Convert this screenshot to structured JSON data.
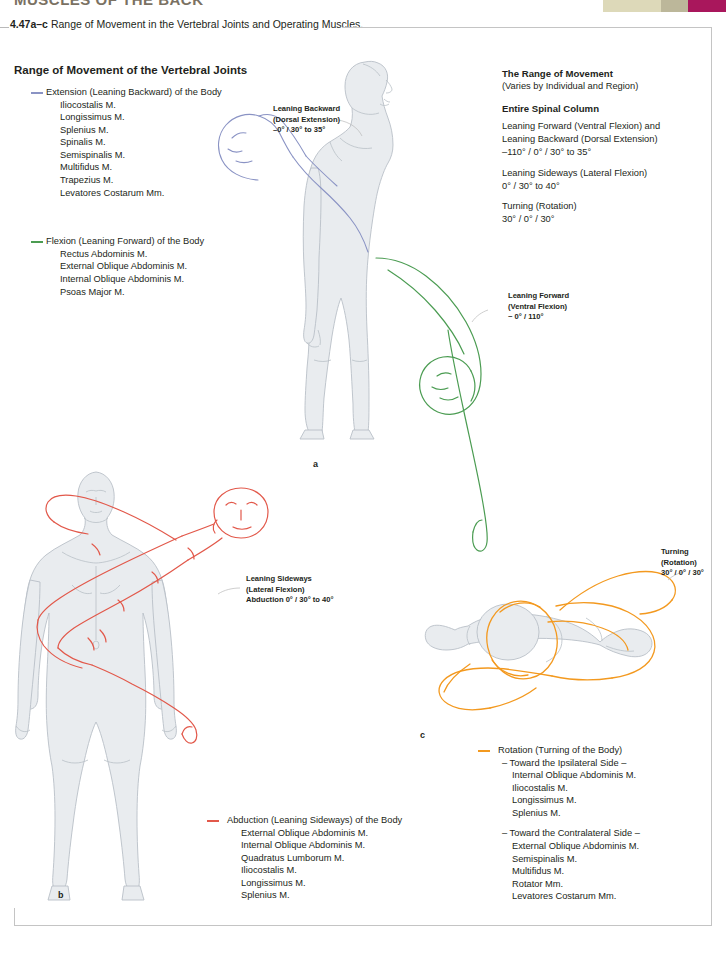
{
  "page": {
    "running_head": "MUSCLES OF THE BACK",
    "caption_number": "4.47a–c",
    "caption_text": "Range of Movement in the Vertebral Joints and Operating Muscles.",
    "colors": {
      "extension": "#8a93c4",
      "flexion": "#4b9c52",
      "abduction": "#e2584a",
      "rotation": "#f3991f",
      "body_fill": "#e9ecef",
      "body_outline": "#b9c0c7",
      "swatch_cream": "#ddd9b9",
      "swatch_olive": "#bcb79a",
      "swatch_magenta": "#a9175c"
    }
  },
  "left_legend": {
    "heading": "Range of Movement of the Vertebral Joints",
    "groups": [
      {
        "marker": "extension-rule",
        "color": "#8a93c4",
        "title": "Extension (Leaning Backward) of the Body",
        "muscles": [
          "Iliocostalis M.",
          "Longissimus M.",
          "Splenius M.",
          "Spinalis M.",
          "Semispinalis M.",
          "Multifidus M.",
          "Trapezius M.",
          "Levatores Costarum Mm."
        ]
      },
      {
        "marker": "flexion-rule",
        "color": "#4b9c52",
        "title": "Flexion (Leaning Forward) of the Body",
        "muscles": [
          "Rectus Abdominis M.",
          "External Oblique Abdominis M.",
          "Internal Oblique Abdominis M.",
          "Psoas Major M."
        ]
      }
    ]
  },
  "right_info": {
    "title": "The Range of Movement",
    "subtitle": "(Varies by Individual and Region)",
    "section": "Entire Spinal Column",
    "entries": [
      {
        "lines": [
          "Leaning Forward (Ventral Flexion) and",
          "Leaning Backward (Dorsal Extension)",
          "–110° / 0° / 30° to 35°"
        ]
      },
      {
        "lines": [
          "Leaning Sideways (Lateral Flexion)",
          " 0° / 30° to 40°"
        ]
      },
      {
        "lines": [
          "Turning (Rotation)",
          "30° / 0° / 30°"
        ]
      }
    ]
  },
  "bottom_legend": {
    "abduction": {
      "color": "#e2584a",
      "title": "Abduction (Leaning Sideways) of the Body",
      "muscles": [
        "External Oblique Abdominis M.",
        "Internal Oblique Abdominis M.",
        "Quadratus Lumborum M.",
        "Iliocostalis M.",
        "Longissimus M.",
        "Splenius M."
      ]
    },
    "rotation": {
      "color": "#f3991f",
      "title": "Rotation (Turning of the Body)",
      "ipsilateral_heading": "– Toward the Ipsilateral Side –",
      "ipsilateral_muscles": [
        "Internal Oblique Abdominis M.",
        "Iliocostalis M.",
        "Longissimus M.",
        "Splenius M."
      ],
      "contralateral_heading": "– Toward the Contralateral Side –",
      "contralateral_muscles": [
        "External Oblique Abdominis M.",
        "Semispinalis M.",
        "Multifidus M.",
        "Rotator Mm.",
        "Levatores Costarum Mm."
      ]
    }
  },
  "callouts": {
    "leaning_backward": {
      "line1": "Leaning Backward",
      "line2": "(Dorsal Extension)",
      "line3": "–0° / 30° to 35°"
    },
    "leaning_forward": {
      "line1": "Leaning Forward",
      "line2": "(Ventral Flexion)",
      "line3": "~ 0° / 110°"
    },
    "leaning_sideways": {
      "line1": "Leaning Sideways",
      "line2": "(Lateral Flexion)",
      "line3": "Abduction 0° / 30° to 40°"
    },
    "turning": {
      "line1": "Turning",
      "line2": "(Rotation)",
      "line3": "30° / 0° / 30°"
    }
  },
  "panel_labels": {
    "a": "a",
    "b": "b",
    "c": "c"
  }
}
